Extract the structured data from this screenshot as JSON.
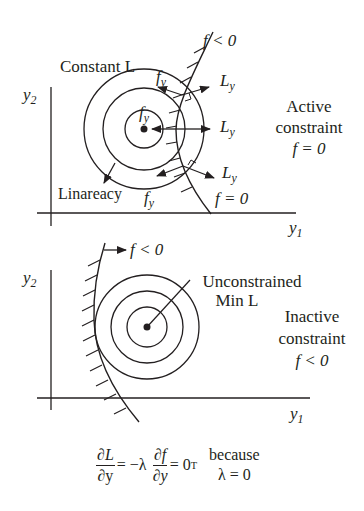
{
  "top_panel": {
    "title_label": "Constant L",
    "axis_y": "y",
    "axis_y_sub": "2",
    "axis_x": "y",
    "axis_x_sub": "1",
    "gradient_f_label": "f",
    "gradient_f_sub": "y",
    "gradient_L_label": "L",
    "gradient_L_sub": "y",
    "infeasible_label": "f < 0",
    "boundary_label": "f = 0",
    "linearity_label": "Linareacy",
    "status_line1": "Active",
    "status_line2": "constraint",
    "status_line3": "f = 0"
  },
  "bottom_panel": {
    "axis_y": "y",
    "axis_y_sub": "2",
    "axis_x": "y",
    "axis_x_sub": "1",
    "infeasible_label": "f < 0",
    "min_line1": "Unconstrained",
    "min_line2": "Min L",
    "status_line1": "Inactive",
    "status_line2": "constraint",
    "status_line3": "f < 0"
  },
  "equation": {
    "lhs_num": "∂L",
    "lhs_den": "∂y",
    "eq_neg_lambda": "= −λ",
    "rhs_num": "∂f",
    "rhs_den": "∂y",
    "eq_zero": "= 0",
    "transpose": "T",
    "because": "because",
    "lambda_zero": "λ = 0"
  },
  "colors": {
    "ink": "#231f20",
    "background": "#ffffff"
  }
}
